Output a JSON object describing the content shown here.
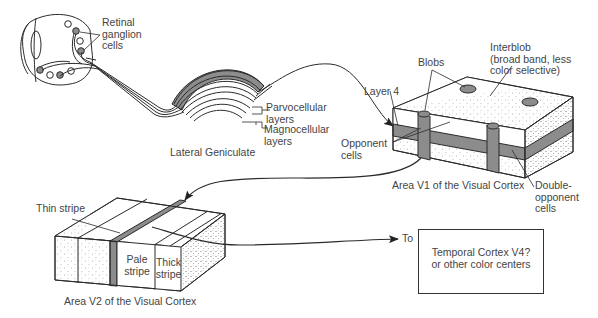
{
  "colors": {
    "stroke": "#2b2b2b",
    "gray_fill": "#8c8c8c",
    "dot": "#bbbbbb",
    "bg": "#ffffff"
  },
  "retina": {
    "label_line1": "Retinal",
    "label_line2": "ganglion",
    "label_line3": "cells"
  },
  "lgn": {
    "title": "Lateral Geniculate",
    "parvo_line1": "Parvocellular",
    "parvo_line2": "layers",
    "magno_line1": "Magnocellular",
    "magno_line2": "layers"
  },
  "v1": {
    "title": "Area V1 of the Visual Cortex",
    "blobs": "Blobs",
    "interblob_line1": "Interblob",
    "interblob_line2": "(broad band, less",
    "interblob_line3": "color selective)",
    "layer4": "Layer 4",
    "opponent_line1": "Opponent",
    "opponent_line2": "cells",
    "double_line1": "Double-",
    "double_line2": "opponent",
    "double_line3": "cells"
  },
  "v2": {
    "title": "Area V2 of the Visual Cortex",
    "thin": "Thin stripe",
    "pale_line1": "Pale",
    "pale_line2": "stripe",
    "thick_line1": "Thick",
    "thick_line2": "stripe"
  },
  "output": {
    "to": "To",
    "box_line1": "Temporal Cortex V4?",
    "box_line2": "or other color centers"
  }
}
